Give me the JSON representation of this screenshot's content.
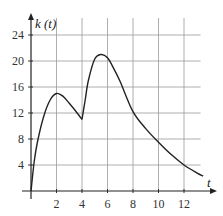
{
  "chart_data": {
    "type": "line",
    "title": "",
    "xlabel": "t",
    "ylabel": "k (t)",
    "xlim": [
      0,
      14
    ],
    "ylim": [
      0,
      26
    ],
    "grid": true,
    "x_ticks": [
      2,
      4,
      6,
      8,
      10,
      12
    ],
    "y_ticks": [
      4,
      8,
      12,
      16,
      20,
      24
    ],
    "x_tick_labels": [
      "2",
      "4",
      "6",
      "8",
      "10",
      "12"
    ],
    "y_tick_labels": [
      "4",
      "8",
      "12",
      "16",
      "20",
      "24"
    ],
    "series": [
      {
        "name": "k(t)",
        "x": [
          0,
          0.25,
          0.5,
          1,
          1.5,
          2,
          2.5,
          3,
          3.5,
          4,
          4.25,
          4.5,
          5,
          5.5,
          6,
          6.5,
          7,
          8,
          9,
          10,
          11,
          12,
          13,
          13.5
        ],
        "values": [
          0,
          4.5,
          7.5,
          11.5,
          14,
          15,
          14.6,
          13.5,
          12.3,
          11,
          14,
          17,
          20.3,
          21,
          20.5,
          18.8,
          16.8,
          12.2,
          9.6,
          7.5,
          5.6,
          4,
          2.8,
          2.3
        ]
      }
    ],
    "annotations": [
      "cusp at t = 4",
      "local max ≈ 15 at t = 2",
      "max ≈ 21 at t ≈ 5.5"
    ]
  },
  "labels": {
    "y_axis": "k (t)",
    "x_axis": "t"
  }
}
